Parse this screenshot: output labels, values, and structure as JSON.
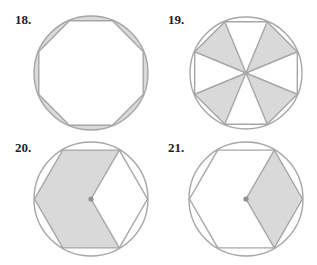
{
  "colors": {
    "fill": "#d9d9d9",
    "stroke": "#a6a6a6",
    "dot": "#8f8f8f",
    "label": "#222222",
    "background": "#ffffff"
  },
  "figures": [
    {
      "label": "18.",
      "shape": "regular octagon inscribed in circle",
      "shaded": "8 circular segments between octagon and circle",
      "cx": 91,
      "cy": 73,
      "r": 57,
      "label_x": 15,
      "label_y": 24
    },
    {
      "label": "19.",
      "shape": "regular octagon inscribed in circle",
      "shaded": "4 of 8 central triangles (top, right, bottom, left)",
      "cx": 246,
      "cy": 73,
      "r": 56,
      "label_x": 168,
      "label_y": 24
    },
    {
      "label": "20.",
      "shape": "regular hexagon inscribed in circle",
      "shaded": "4 of 6 central triangles (left side, chevron shape)",
      "cx": 91,
      "cy": 199,
      "r": 57,
      "label_x": 15,
      "label_y": 152
    },
    {
      "label": "21.",
      "shape": "regular hexagon inscribed in circle",
      "shaded": "2 of 6 central triangles (right rhombus)",
      "cx": 246,
      "cy": 199,
      "r": 57,
      "label_x": 168,
      "label_y": 152
    }
  ]
}
